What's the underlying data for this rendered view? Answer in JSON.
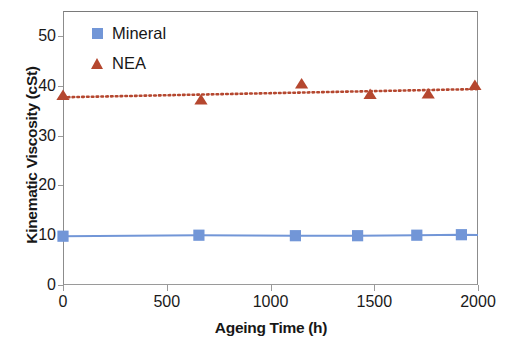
{
  "chart_data": {
    "type": "line",
    "title": "",
    "xlabel": "Ageing Time (h)",
    "ylabel": "Kinematic Viscosity (cSt)",
    "xlim": [
      0,
      2000
    ],
    "ylim": [
      0,
      55
    ],
    "xticks": [
      0,
      500,
      1000,
      1500,
      2000
    ],
    "xtick_labels": [
      "0",
      "500",
      "1000",
      "1500",
      "2000"
    ],
    "yticks": [
      0,
      10,
      20,
      30,
      40,
      50
    ],
    "ytick_labels": [
      "0",
      "10",
      "20",
      "30",
      "40",
      "50"
    ],
    "grid": false,
    "legend_position": "top-left",
    "series": [
      {
        "name": "Mineral",
        "marker": "square",
        "color": "#7296d7",
        "line_style": "solid",
        "x": [
          0,
          655,
          1120,
          1420,
          1705,
          1920
        ],
        "values": [
          9.8,
          10.0,
          9.9,
          9.9,
          10.0,
          10.1
        ]
      },
      {
        "name": "NEA",
        "marker": "triangle",
        "color": "#b5472f",
        "line_style": "dotted",
        "x": [
          0,
          665,
          1150,
          1480,
          1760,
          1985
        ],
        "values": [
          38.0,
          37.1,
          40.3,
          38.2,
          38.3,
          40.0
        ]
      }
    ]
  },
  "legend": {
    "items": [
      {
        "label": "Mineral",
        "marker": "square",
        "color": "#7296d7"
      },
      {
        "label": "NEA",
        "marker": "triangle",
        "color": "#b5472f"
      }
    ]
  },
  "axes": {
    "x_title": "Ageing Time (h)",
    "y_title": "Kinematic Viscosity (cSt)"
  }
}
